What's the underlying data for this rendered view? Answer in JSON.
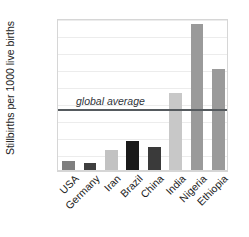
{
  "chart_data": {
    "type": "bar",
    "title": "",
    "subtitle": "",
    "xlabel": "",
    "ylabel": "Stillbirths per 1000 live births",
    "categories": [
      "USA",
      "Germany",
      "Iran",
      "Brazil",
      "China",
      "India",
      "Nigeria",
      "Ethiopia"
    ],
    "values": [
      3.0,
      2.4,
      6.3,
      8.7,
      7.1,
      23.0,
      43.2,
      29.9
    ],
    "bar_colors": [
      "#7f7f7f",
      "#3f3f3f",
      "#c2c2c2",
      "#1a1a1a",
      "#3a3a3a",
      "#c8c8c8",
      "#9a9a9a",
      "#9a9a9a"
    ],
    "ylim": [
      0,
      45
    ],
    "ytick_values": [
      0,
      5,
      10,
      15,
      20,
      25,
      30,
      35,
      40,
      45
    ],
    "ytick_labels": [
      "0",
      "5",
      "10",
      "15",
      "20",
      "25",
      "30",
      "35",
      "40",
      "45"
    ],
    "grid": "horizontal",
    "legend": "none",
    "annotations": [
      {
        "name": "global-average",
        "text": "global average",
        "value": 18.5,
        "style": "italic",
        "line_color": "#555a5e",
        "orientation": "horizontal-reference-line"
      }
    ]
  }
}
